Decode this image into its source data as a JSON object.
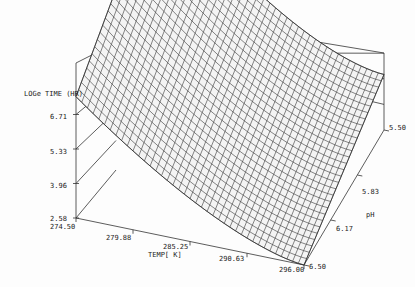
{
  "chart_data": {
    "type": "surface3d",
    "title": "",
    "zlabel": "LOGe TIME (HR)",
    "xlabel": "TEMP[ K]",
    "ylabel": "pH",
    "x_ticks": [
      "274.50",
      "279.88",
      "285.25",
      "290.63",
      "296.00"
    ],
    "y_ticks": [
      "5.50",
      "5.83",
      "6.17",
      "6.50"
    ],
    "z_ticks": [
      "2.58",
      "3.96",
      "5.33",
      "6.71"
    ],
    "x_range": [
      274.5,
      296.0
    ],
    "y_range": [
      5.5,
      6.5
    ],
    "z_range": [
      2.58,
      8.08
    ],
    "surface_corners": {
      "temp_274.50_pH_5.50": 8.08,
      "temp_296.00_pH_5.50": 4.1,
      "temp_274.50_pH_6.50": 5.9,
      "temp_296.00_pH_6.50": 2.58
    },
    "grid": true,
    "mesh_resolution": [
      40,
      30
    ]
  },
  "labels": {
    "zlabel": "LOGe TIME (HR)",
    "xlabel": "TEMP[ K]",
    "ylabel": "pH",
    "z0": "2.58",
    "z1": "3.96",
    "z2": "5.33",
    "z3": "6.71",
    "x0": "274.50",
    "x1": "279.88",
    "x2": "285.25",
    "x3": "290.63",
    "x4": "296.00",
    "y0": "5.50",
    "y1": "5.83",
    "y2": "6.17",
    "y3": "6.50"
  }
}
